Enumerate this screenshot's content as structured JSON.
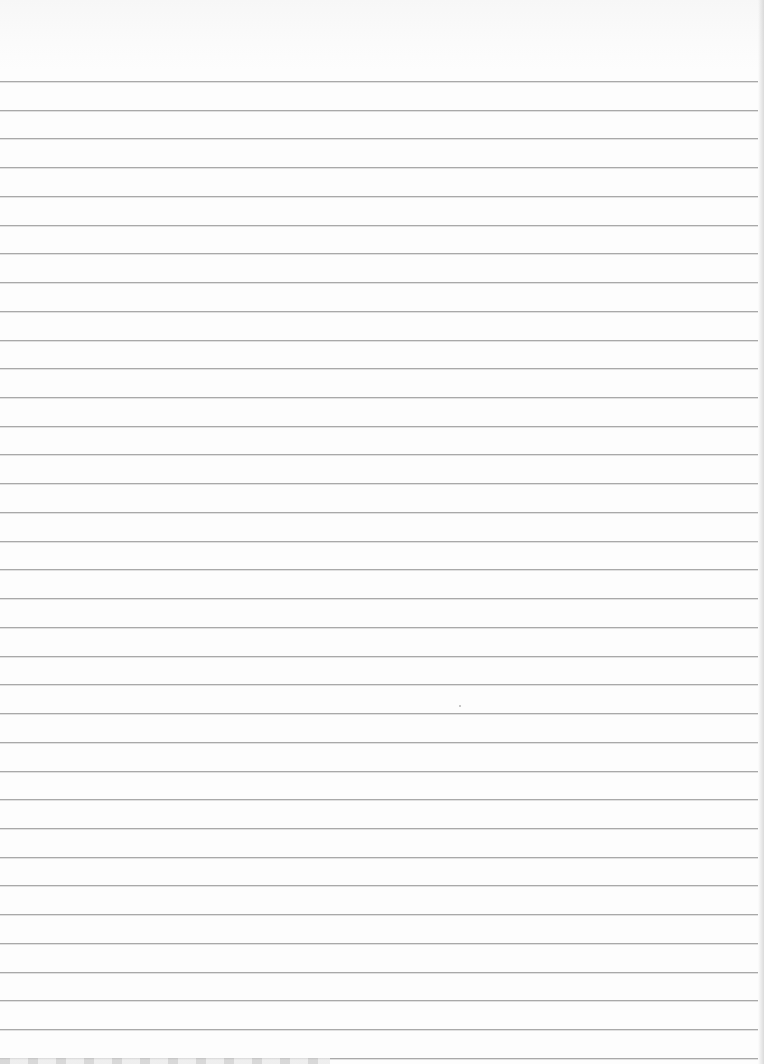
{
  "page": {
    "type": "ruled-paper",
    "width": 764,
    "height": 1064,
    "background_color": "#fdfdfd"
  },
  "rules": {
    "count": 35,
    "first_y": 81,
    "spacing": 28.73,
    "color": "#a9a9a9",
    "left": 0,
    "right_inset": 6
  },
  "specks": [
    {
      "x": 459,
      "y": 705
    }
  ]
}
